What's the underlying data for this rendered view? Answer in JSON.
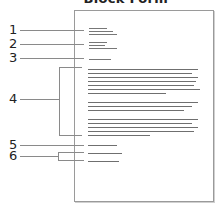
{
  "title": "Block Form",
  "labels": [
    {
      "id": "1",
      "text": "1"
    },
    {
      "id": "2",
      "text": "2"
    },
    {
      "id": "3",
      "text": "3"
    },
    {
      "id": "4",
      "text": "4"
    },
    {
      "id": "5",
      "text": "5"
    },
    {
      "id": "6",
      "text": "6"
    }
  ],
  "page": {
    "sections": [
      {
        "number": "1",
        "role": "sender address block",
        "lines": 3
      },
      {
        "number": "2",
        "role": "recipient address block",
        "lines": 3
      },
      {
        "number": "3",
        "role": "salutation",
        "lines": 1
      },
      {
        "number": "4",
        "role": "body paragraphs",
        "paragraphs": [
          7,
          3,
          5
        ]
      },
      {
        "number": "5",
        "role": "closing",
        "lines": 1
      },
      {
        "number": "6",
        "role": "signature",
        "lines": 2
      }
    ]
  },
  "colors": {
    "text_line": "#6f6f6f",
    "leader": "#8a8a8a",
    "page_border": "#9a9a9a"
  }
}
